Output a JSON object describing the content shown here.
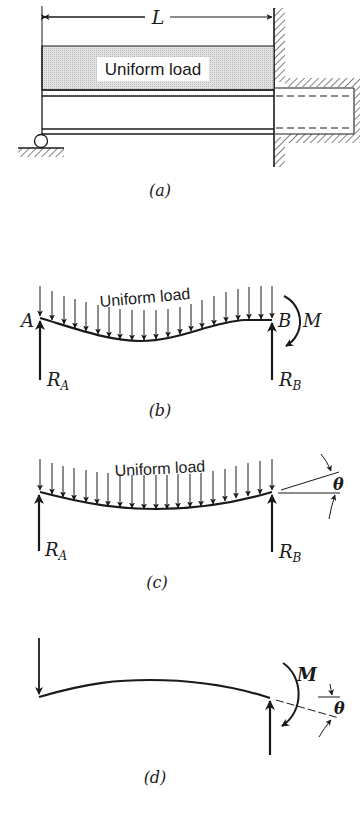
{
  "figure": {
    "panels": [
      {
        "id": "a",
        "caption": "(a)",
        "dimension_label": "L",
        "load_label": "Uniform load",
        "description": "Beam on roller support at left end, built into a wall at right end, carrying a uniform load over span L"
      },
      {
        "id": "b",
        "caption": "(b)",
        "load_label": "Uniform load",
        "point_left": "A",
        "point_right": "B",
        "reaction_left": "R",
        "reaction_left_sub": "A",
        "reaction_right": "R",
        "reaction_right_sub": "B",
        "moment_label": "M",
        "description": "Free body: uniformly loaded beam with reactions R_A, R_B and end moment M at B"
      },
      {
        "id": "c",
        "caption": "(c)",
        "load_label": "Uniform load",
        "reaction_left": "R",
        "reaction_left_sub": "A",
        "reaction_right": "R",
        "reaction_right_sub": "B",
        "angle_label": "θ",
        "description": "Simply supported beam under uniform load; end slope θ at B"
      },
      {
        "id": "d",
        "caption": "(d)",
        "moment_label": "M",
        "angle_label": "θ",
        "description": "Beam under end moment M producing end rotation θ at right support"
      }
    ]
  },
  "colors": {
    "ink": "#1a1a1a",
    "load_fill": "#d9d9d9",
    "background": "#ffffff"
  }
}
